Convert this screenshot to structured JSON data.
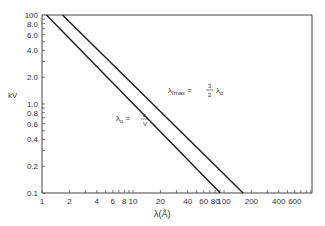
{
  "chart_data": {
    "type": "line",
    "title": "",
    "xlabel": "λ(Å)",
    "ylabel": "kV",
    "xscale": "log",
    "yscale": "log",
    "xlim": [
      1,
      750
    ],
    "ylim": [
      0.1,
      100
    ],
    "grid": false,
    "x_tick_labels": [
      {
        "value": 1,
        "label": "1"
      },
      {
        "value": 2,
        "label": "2"
      },
      {
        "value": 4,
        "label": "4"
      },
      {
        "value": 6,
        "label": "6"
      },
      {
        "value": 8,
        "label": "8"
      },
      {
        "value": 10,
        "label": "10"
      },
      {
        "value": 20,
        "label": "20"
      },
      {
        "value": 40,
        "label": "40"
      },
      {
        "value": 60,
        "label": "60"
      },
      {
        "value": 80,
        "label": "80"
      },
      {
        "value": 100,
        "label": "100"
      },
      {
        "value": 200,
        "label": "200"
      },
      {
        "value": 400,
        "label": "400"
      },
      {
        "value": 600,
        "label": "600"
      }
    ],
    "y_tick_labels": [
      {
        "value": 100,
        "label": "100"
      },
      {
        "value": 80,
        "label": "8.0"
      },
      {
        "value": 60,
        "label": "6.0"
      },
      {
        "value": 40,
        "label": "4.0"
      },
      {
        "value": 20,
        "label": "2.0"
      },
      {
        "value": 10,
        "label": "1.0"
      },
      {
        "value": 8,
        "label": "0.8"
      },
      {
        "value": 6,
        "label": "0.6"
      },
      {
        "value": 4,
        "label": "0.4"
      },
      {
        "value": 2,
        "label": "0.2"
      },
      {
        "value": 1,
        "label": "0.1"
      }
    ],
    "series": [
      {
        "name": "λo = c/V",
        "annotation_main": "λ",
        "annotation_sub": "o",
        "annotation_rest": " = c/V",
        "points": [
          {
            "x": 1.12,
            "y": 100
          },
          {
            "x": 91,
            "y": 1
          }
        ]
      },
      {
        "name": "λImax = 3/2 λo",
        "annotation_main": "λ",
        "annotation_sub": "Imax",
        "annotation_rest": " = 3/2 λo",
        "points": [
          {
            "x": 1.68,
            "y": 100
          },
          {
            "x": 162,
            "y": 1
          }
        ]
      }
    ]
  },
  "labels": {
    "ylabel": "kV",
    "xlabel": "λ(Å)",
    "anno1": "λo = c/V",
    "anno2": "λImax = 3/2 λo"
  }
}
